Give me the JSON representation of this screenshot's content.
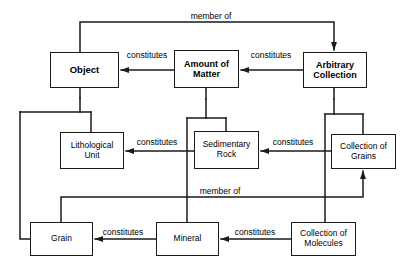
{
  "diagram": {
    "line_color": "#1a1a1a",
    "fill_color": "#ffffff",
    "text_color": "#000000",
    "nodes": [
      {
        "id": "object",
        "label": "Object",
        "bold": true,
        "x": 50,
        "y": 52,
        "w": 69,
        "h": 36,
        "font_size": 9.5
      },
      {
        "id": "amount_of_matter",
        "label": "Amount of\nMatter",
        "bold": true,
        "x": 174,
        "y": 50,
        "w": 65,
        "h": 38,
        "font_size": 9.0
      },
      {
        "id": "arbitrary_collection",
        "label": "Arbitrary\nCollection",
        "bold": true,
        "x": 303,
        "y": 52,
        "w": 64,
        "h": 36,
        "font_size": 9.0
      },
      {
        "id": "lithological_unit",
        "label": "Lithological\nUnit",
        "bold": false,
        "x": 60,
        "y": 132,
        "w": 64,
        "h": 37,
        "font_size": 8.5
      },
      {
        "id": "sedimentary_rock",
        "label": "Sedimentary\nRock",
        "bold": false,
        "x": 194,
        "y": 131,
        "w": 65,
        "h": 38,
        "font_size": 8.5
      },
      {
        "id": "collection_of_grains",
        "label": "Collection of\nGrains",
        "bold": false,
        "x": 331,
        "y": 134,
        "w": 65,
        "h": 35,
        "font_size": 8.5
      },
      {
        "id": "grain",
        "label": "Grain",
        "bold": false,
        "x": 30,
        "y": 222,
        "w": 63,
        "h": 34,
        "font_size": 8.5
      },
      {
        "id": "mineral",
        "label": "Mineral",
        "bold": false,
        "x": 156,
        "y": 222,
        "w": 63,
        "h": 34,
        "font_size": 8.5
      },
      {
        "id": "collection_of_molecules",
        "label": "Collection of\nMolecules",
        "bold": false,
        "x": 291,
        "y": 222,
        "w": 65,
        "h": 34,
        "font_size": 8.5
      }
    ],
    "edge_labels": [
      {
        "id": "member-of-top",
        "text": "member of",
        "x": 211,
        "y": 16,
        "font_size": 8.5
      },
      {
        "id": "constitutes-obj-aom",
        "text": "constitutes",
        "x": 147,
        "y": 55,
        "font_size": 8.5
      },
      {
        "id": "constitutes-aom-ac",
        "text": "constitutes",
        "x": 271,
        "y": 55,
        "font_size": 8.5
      },
      {
        "id": "constitutes-lu-sr",
        "text": "constitutes",
        "x": 157,
        "y": 142,
        "font_size": 8.5
      },
      {
        "id": "constitutes-sr-cg",
        "text": "constitutes",
        "x": 293,
        "y": 142,
        "font_size": 8.5
      },
      {
        "id": "member-of-bottom",
        "text": "member of",
        "x": 220,
        "y": 191,
        "font_size": 8.5
      },
      {
        "id": "constitutes-grain-mineral",
        "text": "constitutes",
        "x": 123,
        "y": 232,
        "font_size": 8.5
      },
      {
        "id": "constitutes-mineral-cm",
        "text": "constitutes",
        "x": 255,
        "y": 232,
        "font_size": 8.5
      }
    ],
    "relations": [
      {
        "id": "member-of-object-to-arbitrary-collection",
        "type": "member of",
        "from": "Object",
        "to": "Arbitrary Collection"
      },
      {
        "id": "constitutes-amount-to-object",
        "type": "constitutes",
        "from": "Amount of Matter",
        "to": "Object"
      },
      {
        "id": "constitutes-arbitrary-to-amount",
        "type": "constitutes",
        "from": "Arbitrary Collection",
        "to": "Amount of Matter"
      },
      {
        "id": "constitutes-sedimentary-to-lithological",
        "type": "constitutes",
        "from": "Sedimentary Rock",
        "to": "Lithological Unit"
      },
      {
        "id": "constitutes-grains-to-sedimentary",
        "type": "constitutes",
        "from": "Collection of Grains",
        "to": "Sedimentary Rock"
      },
      {
        "id": "constitutes-mineral-to-grain",
        "type": "constitutes",
        "from": "Mineral",
        "to": "Grain"
      },
      {
        "id": "constitutes-molecules-to-mineral",
        "type": "constitutes",
        "from": "Collection of Molecules",
        "to": "Mineral"
      },
      {
        "id": "member-of-grain-to-collection-of-grains",
        "type": "member of",
        "from": "Grain",
        "to": "Collection of Grains"
      },
      {
        "id": "generalization-lithological-unit-object",
        "type": "generalization",
        "from": "Lithological Unit",
        "to": "Object"
      },
      {
        "id": "generalization-grain-object",
        "type": "generalization",
        "from": "Grain",
        "to": "Object"
      },
      {
        "id": "generalization-sedimentary-rock-amount",
        "type": "generalization",
        "from": "Sedimentary Rock",
        "to": "Amount of Matter"
      },
      {
        "id": "generalization-mineral-amount",
        "type": "generalization",
        "from": "Mineral",
        "to": "Amount of Matter"
      },
      {
        "id": "generalization-collection-grains-arbitrary",
        "type": "generalization",
        "from": "Collection of Grains",
        "to": "Arbitrary Collection"
      },
      {
        "id": "generalization-collection-molecules-arbitrary",
        "type": "generalization",
        "from": "Collection of Molecules",
        "to": "Arbitrary Collection"
      }
    ]
  }
}
